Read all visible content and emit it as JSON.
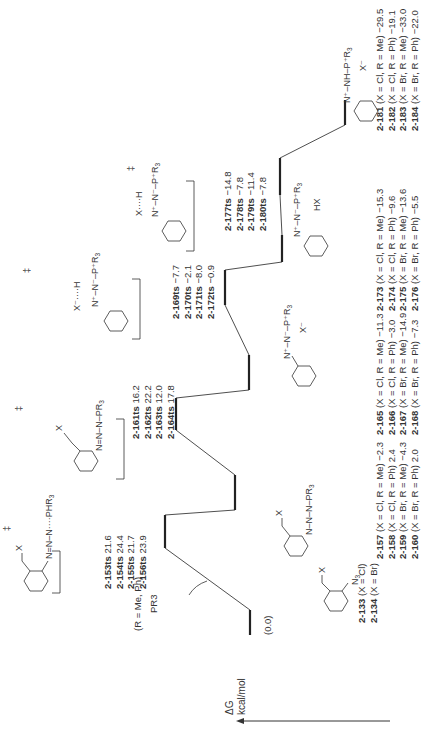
{
  "axis": {
    "label": "ΔG",
    "unit": "kcal/mol",
    "direction": "energy increases upward (rotated: toward left edge)"
  },
  "reagent_note": "(R = Me, Ph)",
  "reagent": "PR3",
  "chart_data": {
    "type": "energy_profile",
    "title": "",
    "ylabel": "ΔG kcal/mol",
    "xlabel": "",
    "levels": [
      {
        "id": "start",
        "label": "(0.0)",
        "species": [
          {
            "name": "2-133",
            "desc": "(X = Cl)"
          },
          {
            "name": "2-134",
            "desc": "(X = Br)"
          }
        ],
        "values": [
          0.0,
          0.0
        ],
        "kind": "minimum"
      },
      {
        "id": "ts1",
        "species": [
          {
            "name": "2-153ts",
            "value": 21.6
          },
          {
            "name": "2-154ts",
            "value": 24.4
          },
          {
            "name": "2-155ts",
            "value": 21.7
          },
          {
            "name": "2-156ts",
            "value": 23.9
          }
        ],
        "kind": "transition-state"
      },
      {
        "id": "int1",
        "species": [
          {
            "name": "2-157",
            "desc": "(X = Cl, R = Me)",
            "value": -2.3
          },
          {
            "name": "2-158",
            "desc": "(X = Cl, R = Ph)",
            "value": 2.4
          },
          {
            "name": "2-159",
            "desc": "(X = Br, R = Me)",
            "value": -4.3
          },
          {
            "name": "2-160",
            "desc": "(X = Br, R = Ph)",
            "value": 2.0
          }
        ],
        "kind": "minimum"
      },
      {
        "id": "ts2",
        "species": [
          {
            "name": "2-161ts",
            "value": 16.2
          },
          {
            "name": "2-162ts",
            "value": 22.2
          },
          {
            "name": "2-163ts",
            "value": 12.0
          },
          {
            "name": "2-164ts",
            "value": 17.8
          }
        ],
        "kind": "transition-state"
      },
      {
        "id": "int2",
        "species": [
          {
            "name": "2-165",
            "desc": "(X = Cl, R = Me)",
            "value": -11.3
          },
          {
            "name": "2-166",
            "desc": "(X = Cl, R = Ph)",
            "value": -3.0
          },
          {
            "name": "2-167",
            "desc": "(X = Br, R = Me)",
            "value": -14.9
          },
          {
            "name": "2-168",
            "desc": "(X = Br, R = Ph)",
            "value": -7.3
          }
        ],
        "kind": "minimum"
      },
      {
        "id": "ts3",
        "species": [
          {
            "name": "2-169ts",
            "value": -7.7
          },
          {
            "name": "2-170ts",
            "value": -2.1
          },
          {
            "name": "2-171ts",
            "value": -8.0
          },
          {
            "name": "2-172ts",
            "value": -0.9
          }
        ],
        "kind": "transition-state"
      },
      {
        "id": "int3",
        "species": [
          {
            "name": "2-173",
            "desc": "(X = Cl, R = Me)",
            "value": -15.3
          },
          {
            "name": "2-174",
            "desc": "(X = Cl, R = Ph)",
            "value": -9.6
          },
          {
            "name": "2-175",
            "desc": "(X = Br, R = Me)",
            "value": -13.6
          },
          {
            "name": "2-176",
            "desc": "(X = Br, R = Ph)",
            "value": -5.5
          }
        ],
        "kind": "minimum"
      },
      {
        "id": "ts4",
        "species": [
          {
            "name": "2-177ts",
            "value": -14.8
          },
          {
            "name": "2-178ts",
            "value": -7.8
          },
          {
            "name": "2-179ts",
            "value": -11.4
          },
          {
            "name": "2-180ts",
            "value": -7.8
          }
        ],
        "kind": "transition-state"
      },
      {
        "id": "prod",
        "species": [
          {
            "name": "2-181",
            "desc": "(X = Cl, R = Me)",
            "value": -29.5
          },
          {
            "name": "2-182",
            "desc": "(X = Cl, R = Ph)",
            "value": -19.1
          },
          {
            "name": "2-183",
            "desc": "(X = Br, R = Me)",
            "value": -33.0
          },
          {
            "name": "2-184",
            "desc": "(X = Br, R = Ph)",
            "value": -22.0
          }
        ],
        "kind": "minimum"
      }
    ],
    "annotations": [
      "(R = Me, Ph)",
      "PR3",
      "HX",
      "‡"
    ]
  },
  "structures": {
    "s133": {
      "sub": "N3",
      "x": "X"
    },
    "ts1": {
      "atoms": "N=N–N····PHR3",
      "x": "X"
    },
    "i157": {
      "atoms": "N–N–N–PR3",
      "x": "X"
    },
    "ts2": {
      "atoms": "N=N–N–PR3",
      "x": "X"
    },
    "i165": {
      "atoms": "N+–N––P+R3",
      "counter": "X–"
    },
    "ts3": {
      "atoms": "X–····H",
      "pr": "PR3"
    },
    "i173": {
      "atoms": "N–N–PR3",
      "extra": "HX"
    },
    "ts4": {
      "atoms": "X····H",
      "pr": "PR3"
    },
    "p181": {
      "atoms": "N+–NH–P+R3",
      "counter": "X–"
    }
  },
  "text": {
    "start_value": "(0.0)",
    "ts1": [
      "2-153ts 21.6",
      "2-154ts 24.4",
      "2-155ts 21.7",
      "2-156ts 23.9"
    ],
    "int1": [
      "2-157 (X = Cl, R = Me) −2.3",
      "2-158 (X = Cl, R = Ph) 2.4",
      "2-159 (X = Br, R = Me) −4.3",
      "2-160 (X = Br, R = Ph) 2.0"
    ],
    "ts2": [
      "2-161ts 16.2",
      "2-162ts 22.2",
      "2-163ts 12.0",
      "2-164ts 17.8"
    ],
    "int2": [
      "2-165 (X = Cl, R = Me) −11.3",
      "2-166 (X = Cl, R = Ph) −3.0",
      "2-167 (X = Br, R = Me) −14.9",
      "2-168 (X = Br, R = Ph) −7.3"
    ],
    "ts3": [
      "2-169ts −7.7",
      "2-170ts −2.1",
      "2-171ts −8.0",
      "2-172ts −0.9"
    ],
    "int3": [
      "2-173 (X = Cl, R = Me) −15.3",
      "2-174 (X = Cl, R = Ph) −9.6",
      "2-175 (X = Br, R = Me) −13.6",
      "2-176 (X = Br, R = Ph) −5.5"
    ],
    "ts4": [
      "2-177ts −14.8",
      "2-178ts −7.8",
      "2-179ts −11.4",
      "2-180ts −7.8"
    ],
    "prod": [
      "2-181 (X = Cl, R = Me) −29.5",
      "2-182 (X = Cl, R = Ph) −19.1",
      "2-183 (X = Br, R = Me) −33.0",
      "2-184 (X = Br, R = Ph) −22.0"
    ],
    "start": [
      "2-133 (X = Cl)",
      "2-134 (X = Br)"
    ]
  }
}
